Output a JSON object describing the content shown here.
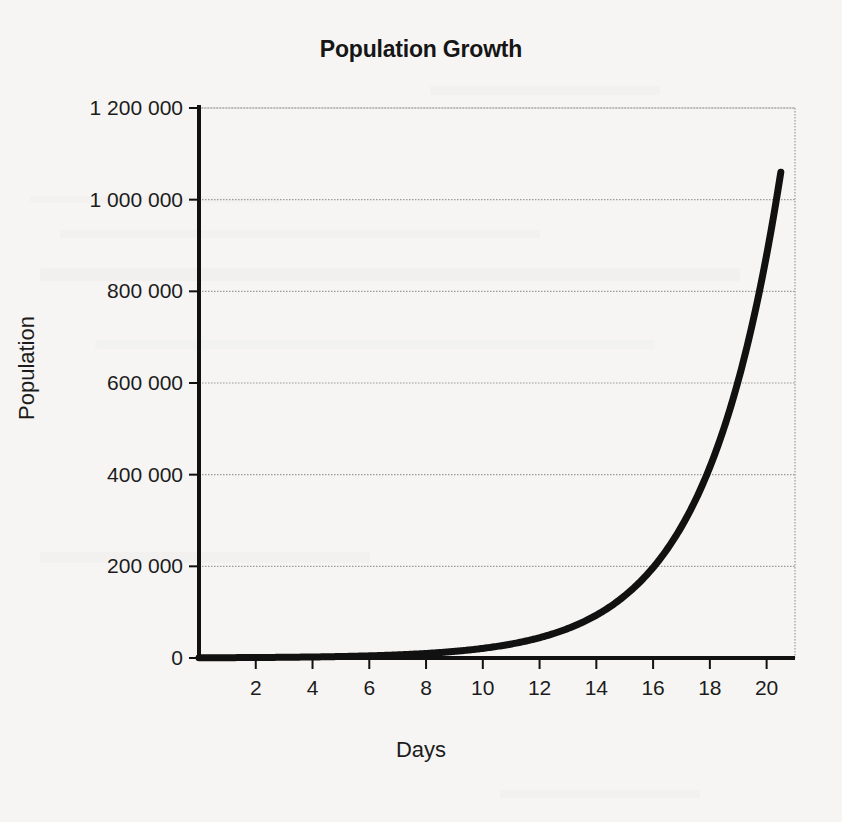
{
  "chart_data": {
    "type": "line",
    "title": "Population Growth",
    "xlabel": "Days",
    "ylabel": "Population",
    "grid": true,
    "legend": null,
    "xlim": [
      0,
      21
    ],
    "ylim": [
      0,
      1200000
    ],
    "xticks": [
      2,
      4,
      6,
      8,
      10,
      12,
      14,
      16,
      18,
      20
    ],
    "xtick_labels": [
      "2",
      "4",
      "6",
      "8",
      "10",
      "12",
      "14",
      "16",
      "18",
      "20"
    ],
    "yticks": [
      0,
      200000,
      400000,
      600000,
      800000,
      1000000,
      1200000
    ],
    "ytick_labels": [
      "0",
      "200 000",
      "400 000",
      "600 000",
      "800 000",
      "1 000 000",
      "1 200 000"
    ],
    "series": [
      {
        "name": "Population",
        "color": "#111111",
        "line_width": 7,
        "x": [
          0,
          1,
          2,
          3,
          4,
          5,
          6,
          7,
          8,
          9,
          10,
          11,
          12,
          13,
          14,
          15,
          16,
          17,
          18,
          19,
          20,
          20.5
        ],
        "values": [
          500,
          760,
          1150,
          1750,
          2650,
          4000,
          6100,
          9200,
          14000,
          21200,
          32100,
          48600,
          73600,
          111500,
          168800,
          255600,
          387000,
          58600,
          887000,
          1000000,
          1045000,
          1060000
        ]
      }
    ],
    "annotations": []
  },
  "axes": {
    "title": "Population Growth",
    "y_axis_label": "Population",
    "x_axis_label": "Days",
    "y_tick_labels": [
      "1 200 000",
      "1 000 000",
      "800 000",
      "600 000",
      "400 000",
      "200 000",
      "0"
    ],
    "x_tick_labels": [
      "2",
      "4",
      "6",
      "8",
      "10",
      "12",
      "14",
      "16",
      "18",
      "20"
    ]
  },
  "colors": {
    "background": "#f6f5f3",
    "curve": "#111111",
    "axis": "#111111",
    "grid": "#9a9a9a",
    "text": "#1c1c1c"
  }
}
